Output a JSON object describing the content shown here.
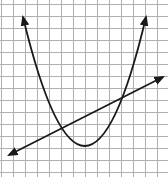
{
  "graph": {
    "width": 168,
    "height": 177,
    "background": "#ffffff",
    "grid_color": "#b0b0b0",
    "curve_color": "#1a1a1a",
    "grid": {
      "x_lines": [
        1,
        13,
        25,
        37,
        49,
        61,
        73,
        85,
        97,
        109,
        121,
        133,
        145,
        157
      ],
      "y_lines": [
        4,
        16,
        28,
        40,
        52,
        64,
        76,
        88,
        100,
        112,
        124,
        136,
        148,
        160,
        172
      ]
    },
    "parabola": {
      "start": [
        23,
        17
      ],
      "control": [
        85,
        275
      ],
      "end": [
        146,
        17
      ],
      "vertex": [
        86,
        146
      ]
    },
    "line": {
      "start": [
        9,
        155
      ],
      "end": [
        163,
        77
      ]
    },
    "intersections": [
      [
        61,
        128
      ],
      [
        121,
        98
      ]
    ]
  }
}
